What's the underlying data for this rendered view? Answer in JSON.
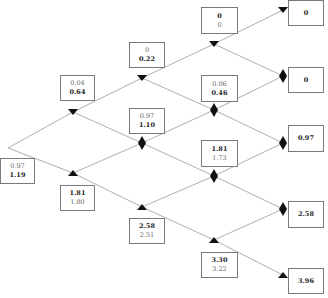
{
  "diagram": {
    "type": "binomial-tree",
    "colors": {
      "edge": "#9a9a9a",
      "box_border": "#7a7a7a",
      "marker": "#111111"
    },
    "nodes": {
      "n0": {
        "line1": "0.97",
        "line2": "1.19",
        "bold": 2,
        "marker": "none"
      },
      "n1u": {
        "line1": "0.04",
        "line2": "0.64",
        "bold": 2,
        "marker": "triangle-down"
      },
      "n1d": {
        "line1": "1.81",
        "line2": "1.80",
        "bold": 1,
        "marker": "triangle-up"
      },
      "n2a": {
        "line1": "0",
        "line2": "0.22",
        "bold": 2,
        "marker": "triangle-down"
      },
      "n2b": {
        "line1": "0.97",
        "line2": "1.10",
        "bold": 2,
        "marker": "diamond"
      },
      "n2c": {
        "line1": "2.58",
        "line2": "2.51",
        "bold": 1,
        "marker": "triangle-up"
      },
      "n3a": {
        "line1": "0",
        "line2": "0",
        "bold": 1,
        "marker": "triangle-down"
      },
      "n3b": {
        "line1": "0.06",
        "line2": "0.46",
        "bold": 2,
        "marker": "diamond"
      },
      "n3c": {
        "line1": "1.81",
        "line2": "1.73",
        "bold": 1,
        "marker": "diamond"
      },
      "n3d": {
        "line1": "3.30",
        "line2": "3.22",
        "bold": 1,
        "marker": "triangle-up"
      },
      "n4a": {
        "line1": "0",
        "marker": "triangle-down"
      },
      "n4b": {
        "line1": "0",
        "marker": "diamond"
      },
      "n4c": {
        "line1": "0.97",
        "marker": "diamond"
      },
      "n4d": {
        "line1": "2.58",
        "marker": "diamond"
      },
      "n4e": {
        "line1": "3.96",
        "marker": "triangle-up"
      }
    }
  }
}
